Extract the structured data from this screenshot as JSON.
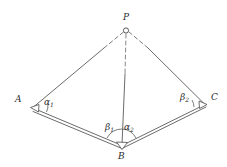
{
  "figure": {
    "stroke_color": "#555555",
    "label_color": "#2b2b2b",
    "background_color": "#ffffff",
    "vertices": [
      {
        "id": "P",
        "label": "P",
        "x": 126,
        "y": 30,
        "label_x": 123,
        "label_y": 14,
        "marker": "circle"
      },
      {
        "id": "A",
        "label": "A",
        "x": 32,
        "y": 108,
        "label_x": 15,
        "label_y": 96,
        "marker": "open-arrow"
      },
      {
        "id": "B",
        "label": "B",
        "x": 121,
        "y": 146,
        "label_x": 118,
        "label_y": 152,
        "marker": "open-arrow"
      },
      {
        "id": "C",
        "label": "C",
        "x": 205,
        "y": 104,
        "label_x": 211,
        "label_y": 94,
        "marker": "open-arrow"
      }
    ],
    "angles": [
      {
        "id": "alpha1",
        "base": "α",
        "sub": "1",
        "at": "A",
        "label_x": 44,
        "label_y": 99
      },
      {
        "id": "beta1",
        "base": "β",
        "sub": "1",
        "at": "B",
        "label_x": 106,
        "label_y": 124
      },
      {
        "id": "alpha2",
        "base": "α",
        "sub": "2",
        "at": "B",
        "label_x": 124,
        "label_y": 124
      },
      {
        "id": "beta2",
        "base": "β",
        "sub": "2",
        "at": "C",
        "label_x": 181,
        "label_y": 94
      }
    ],
    "edges": [
      {
        "id": "AP",
        "from": "A",
        "to": "P",
        "style": "solid-then-dashed",
        "note": "solid from A, dashed near P"
      },
      {
        "id": "CP",
        "from": "C",
        "to": "P",
        "style": "solid-then-dashed",
        "note": "solid from C, dashed near P"
      },
      {
        "id": "PB",
        "from": "P",
        "to": "B",
        "style": "dashed-then-solid",
        "note": "vertical, dashed near P, solid to B"
      },
      {
        "id": "AB",
        "from": "A",
        "to": "B",
        "style": "double-line",
        "note": "baseline segment drawn as band"
      },
      {
        "id": "BC",
        "from": "B",
        "to": "C",
        "style": "double-line",
        "note": "baseline segment drawn as band"
      }
    ]
  }
}
